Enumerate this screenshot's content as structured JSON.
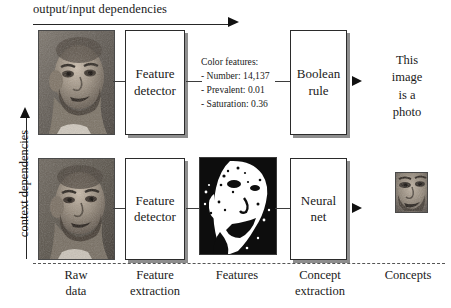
{
  "diagram": {
    "top_axis_label": "output/input dependencies",
    "left_axis_label": "context dependencies",
    "boxes": {
      "feature_detector_top": "Feature\ndetector",
      "feature_detector_bottom": "Feature\ndetector",
      "boolean_rule": "Boolean\nrule",
      "neural_net": "Neural\nnet"
    },
    "color_features": {
      "heading": "Color features:",
      "lines": [
        "- Number: 14,137",
        "- Prevalent: 0.01",
        "- Saturation: 0.36"
      ]
    },
    "output_text": "This\nimage\nis a\nphoto",
    "stage_labels": [
      "Raw\ndata",
      "Feature\nextraction",
      "Features",
      "Concept\nextraction",
      "Concepts"
    ],
    "images": {
      "raw_photo_top": "grayscale-portrait-photo",
      "raw_photo_bottom": "grayscale-portrait-photo",
      "features_binary": "binary-thresholded-face-silhouette",
      "concept_thumb": "grayscale-face-crop-thumbnail"
    },
    "colors": {
      "ink": "#1a1a1a",
      "box_border": "#2b2b2b",
      "box_shadow": "#8e8e8e",
      "divider": "#555555",
      "background": "#ffffff"
    }
  }
}
